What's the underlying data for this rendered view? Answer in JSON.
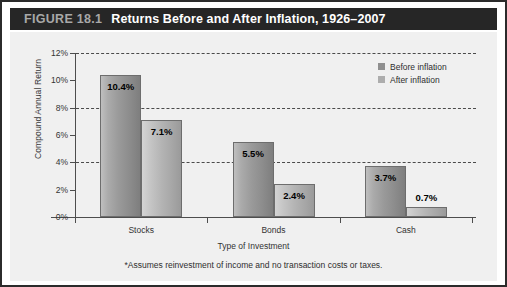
{
  "figure": {
    "number": "FIGURE 18.1",
    "title": "Returns Before and After Inflation, 1926–2007"
  },
  "footnote": "*Assumes reinvestment of income and no transaction costs or taxes.",
  "legend": {
    "position": "top-right",
    "entries": [
      {
        "label": "Before inflation",
        "color": "#8f8f8f"
      },
      {
        "label": "After inflation",
        "color": "#adadad"
      }
    ]
  },
  "chart_data": {
    "type": "bar",
    "title": "Returns Before and After Inflation, 1926–2007",
    "xlabel": "Type of Investment",
    "ylabel": "Compound Annual Return",
    "categories": [
      "Stocks",
      "Bonds",
      "Cash"
    ],
    "series": [
      {
        "name": "Before inflation",
        "values": [
          10.4,
          5.5,
          3.7
        ],
        "labels": [
          "10.4%",
          "5.5%",
          "3.7%"
        ],
        "color": "#8f8f8f"
      },
      {
        "name": "After inflation",
        "values": [
          7.1,
          2.4,
          0.7
        ],
        "labels": [
          "7.1%",
          "2.4%",
          "0.7%"
        ],
        "color": "#adadad"
      }
    ],
    "ylim": [
      0,
      12
    ],
    "yunit": "%",
    "yticks": [
      0,
      2,
      4,
      6,
      8,
      10,
      12
    ],
    "ytick_labels": [
      "0%",
      "2%",
      "4%",
      "6%",
      "8%",
      "10%",
      "12%"
    ],
    "gridlines_at": [
      4,
      8,
      12
    ],
    "grid": true,
    "grid_style": "dashed"
  }
}
